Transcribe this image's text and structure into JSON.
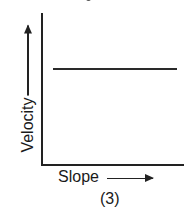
{
  "chart_data": {
    "type": "line",
    "title": "",
    "xlabel": "Slope",
    "ylabel": "Velocity",
    "caption": "(3)",
    "series": [
      {
        "name": "velocity",
        "x": [
          0.08,
          0.96
        ],
        "values": [
          0.65,
          0.65
        ]
      }
    ],
    "xlim": [
      0,
      1
    ],
    "ylim": [
      0,
      1
    ],
    "grid": false,
    "ticks": "none",
    "axis_arrows": true
  },
  "labels": {
    "x_axis": "Slope",
    "y_axis": "Velocity",
    "figure_number": "(3)"
  }
}
